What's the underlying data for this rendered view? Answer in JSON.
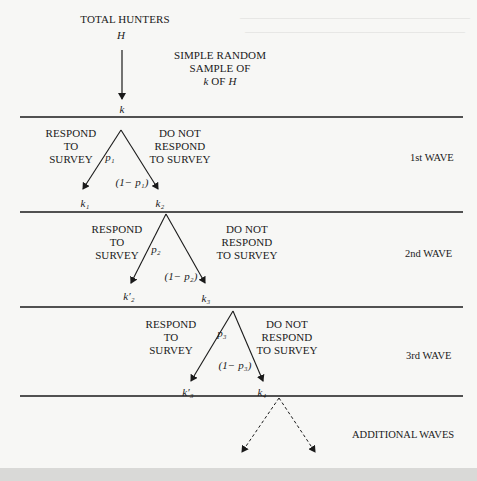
{
  "diagram": {
    "title_node": {
      "label": "TOTAL HUNTERS",
      "variable": "H"
    },
    "sample_annotation": {
      "line1": "SIMPLE RANDOM",
      "line2": "SAMPLE  OF",
      "line3_var1": "k",
      "line3_mid": "OF",
      "line3_var2": "H"
    },
    "sample_node": "k",
    "waves": [
      {
        "name": "1st WAVE",
        "respond_label": [
          "RESPOND",
          "TO",
          "SURVEY"
        ],
        "nonrespond_label": [
          "DO NOT",
          "RESPOND",
          "TO SURVEY"
        ],
        "p_label": "p₁",
        "one_minus_p_label": "(1− p₁)",
        "respond_node": "k₁",
        "nonrespond_node": "k₂"
      },
      {
        "name": "2nd WAVE",
        "respond_label": [
          "RESPOND",
          "TO",
          "SURVEY"
        ],
        "nonrespond_label": [
          "DO NOT",
          "RESPOND",
          "TO SURVEY"
        ],
        "p_label": "p₂",
        "one_minus_p_label": "(1− p₂)",
        "respond_node": "k′₂",
        "nonrespond_node": "k₃"
      },
      {
        "name": "3rd WAVE",
        "respond_label": [
          "RESPOND",
          "TO",
          "SURVEY"
        ],
        "nonrespond_label": [
          "DO NOT",
          "RESPOND",
          "TO SURVEY"
        ],
        "p_label": "p₃",
        "one_minus_p_label": "(1− p₃)",
        "respond_node": "k′₃",
        "nonrespond_node": "k₄"
      }
    ],
    "additional": "ADDITIONAL WAVES"
  },
  "colors": {
    "ink": "#1a1a1a",
    "paper": "#f7f7f5",
    "band": "#d9d9d7"
  }
}
